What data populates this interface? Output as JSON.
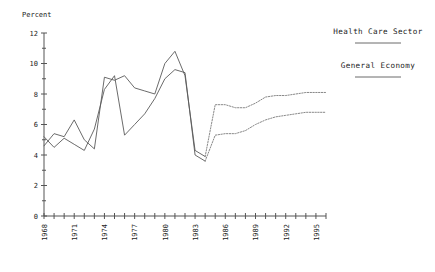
{
  "chart_data": {
    "type": "line",
    "title": "",
    "xlabel": "",
    "ylabel": "Percent",
    "ylim": [
      0,
      12
    ],
    "xlim": [
      1968,
      1996
    ],
    "ytick_labels": [
      "0",
      "2",
      "4",
      "6",
      "8",
      "10",
      "12"
    ],
    "ytick_values": [
      0,
      2,
      4,
      6,
      8,
      10,
      12
    ],
    "xtick_labels": [
      "1968",
      "1971",
      "1974",
      "1977",
      "1980",
      "1983",
      "1986",
      "1989",
      "1992",
      "1995"
    ],
    "xtick_values": [
      1968,
      1971,
      1974,
      1977,
      1980,
      1983,
      1986,
      1989,
      1992,
      1995
    ],
    "grid": false,
    "legend_position": "right",
    "x": [
      1968,
      1969,
      1970,
      1971,
      1972,
      1973,
      1974,
      1975,
      1976,
      1977,
      1978,
      1979,
      1980,
      1981,
      1982,
      1983,
      1984,
      1985,
      1986,
      1987,
      1988,
      1989,
      1990,
      1991,
      1992,
      1993,
      1994,
      1995,
      1996
    ],
    "series": [
      {
        "name": "Health Care Sector",
        "linestyle": "solid-then-dotted",
        "solid_through": 1984,
        "values": [
          4.6,
          5.4,
          5.2,
          6.3,
          5.0,
          4.4,
          9.1,
          8.9,
          9.2,
          8.4,
          8.2,
          8.0,
          10.0,
          10.8,
          9.2,
          4.3,
          3.9,
          7.3,
          7.3,
          7.1,
          7.1,
          7.4,
          7.8,
          7.9,
          7.9,
          8.0,
          8.1,
          8.1,
          8.1
        ]
      },
      {
        "name": "General Economy",
        "linestyle": "solid-then-dotted",
        "solid_through": 1984,
        "values": [
          5.2,
          4.5,
          5.1,
          4.7,
          4.3,
          5.7,
          8.3,
          9.2,
          5.3,
          6.0,
          6.7,
          7.7,
          9.0,
          9.6,
          9.4,
          4.0,
          3.6,
          5.3,
          5.4,
          5.4,
          5.6,
          6.0,
          6.3,
          6.5,
          6.6,
          6.7,
          6.8,
          6.8,
          6.8
        ]
      }
    ],
    "annotations": []
  },
  "legend": {
    "items": [
      {
        "label": "Health Care Sector"
      },
      {
        "label": "General Economy"
      }
    ]
  }
}
